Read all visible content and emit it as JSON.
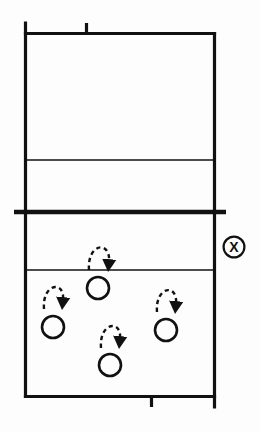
{
  "diagram": {
    "type": "court-diagram",
    "canvas": {
      "width": 260,
      "height": 432
    },
    "colors": {
      "ink": "#111111",
      "background": "#fdfdfd",
      "line": "#111111"
    },
    "court": {
      "name": "court-outline",
      "left": 25.5,
      "right": 214.5,
      "top": 33.5,
      "bottom": 396.5,
      "border_width": 3.2,
      "left_post_top": 23,
      "right_post_bottom": 407
    },
    "lines": [
      {
        "name": "far-attack-line",
        "type": "thin-horizontal",
        "y": 160,
        "x1": 25.5,
        "x2": 214.5,
        "width": 1.6
      },
      {
        "name": "center-net-line",
        "type": "thick-horizontal",
        "y": 212,
        "x1": 14,
        "x2": 226,
        "width": 4.4
      },
      {
        "name": "near-attack-line",
        "type": "thin-horizontal",
        "y": 270,
        "x1": 25.5,
        "x2": 214.5,
        "width": 1.6
      }
    ],
    "ticks": [
      {
        "name": "top-center-tick",
        "x": 86.5,
        "y1": 23,
        "y2": 34,
        "width": 3.2
      },
      {
        "name": "bottom-center-tick",
        "x": 151.5,
        "y1": 396,
        "y2": 407,
        "width": 3.2
      }
    ],
    "players": [
      {
        "name": "player-circle-back-left",
        "label": "O",
        "cx": 53,
        "cy": 327,
        "r": 11,
        "stroke": 2.6
      },
      {
        "name": "player-circle-front-center",
        "label": "O",
        "cx": 98,
        "cy": 288,
        "r": 11,
        "stroke": 2.6
      },
      {
        "name": "player-circle-back-center",
        "label": "O",
        "cx": 110,
        "cy": 365,
        "r": 11,
        "stroke": 2.6
      },
      {
        "name": "player-circle-back-right",
        "label": "O",
        "cx": 166,
        "cy": 330,
        "r": 11,
        "stroke": 2.6
      }
    ],
    "movement_arrows": [
      {
        "name": "movement-arrow-front-center",
        "start_x": 89,
        "start_y": 270,
        "peak_x": 99,
        "peak_y": 240,
        "end_x": 109,
        "end_y": 268
      },
      {
        "name": "movement-arrow-back-left",
        "start_x": 44,
        "start_y": 309,
        "peak_x": 54,
        "peak_y": 280,
        "end_x": 63,
        "end_y": 306
      },
      {
        "name": "movement-arrow-back-right",
        "start_x": 157,
        "start_y": 312,
        "peak_x": 167,
        "peak_y": 283,
        "end_x": 176,
        "end_y": 310
      },
      {
        "name": "movement-arrow-back-center",
        "start_x": 101,
        "start_y": 348,
        "peak_x": 111,
        "peak_y": 318,
        "end_x": 120,
        "end_y": 345
      }
    ],
    "markers": [
      {
        "name": "ball-marker-circled-x",
        "symbol": "X",
        "cx": 234,
        "cy": 247,
        "r": 10.5,
        "stroke": 2.2,
        "description": "circled X marker at right sideline"
      }
    ]
  }
}
